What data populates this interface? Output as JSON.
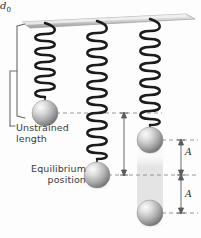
{
  "figure": {
    "background_color": "#fdfdfd",
    "ceiling": {
      "name": "support-ceiling",
      "color_top": "#e9e9e9",
      "color_bottom": "#a8a8a8"
    },
    "colors": {
      "spring": "#1b1b1b",
      "ball_light": "#f2f2f2",
      "ball_mid": "#bdbdbd",
      "ball_dark": "#6f6f6f",
      "dashed_line": "#8c8c8c",
      "bracket": "#6b6b6b",
      "text": "#3a3a3a",
      "blur_trail": "#e3e3e3"
    },
    "labels": {
      "unstrained_line1": "Unstrained",
      "unstrained_line2": "length",
      "equilibrium_line1": "Equilibrium",
      "equilibrium_line2": "position",
      "displacement_symbol": "d",
      "displacement_subscript": "0",
      "amplitude_upper": "A",
      "amplitude_lower": "A"
    },
    "springs": [
      {
        "name": "spring-unstrained",
        "state": "unstrained",
        "coils": 7,
        "top_y": 22,
        "bottom_y": 100,
        "center_x": 45
      },
      {
        "name": "spring-equilibrium",
        "state": "stretched-to-equilibrium",
        "coils": 10,
        "top_y": 22,
        "bottom_y": 162,
        "center_x": 97
      },
      {
        "name": "spring-oscillating",
        "state": "stretched-oscillating",
        "coils": 9,
        "top_y": 22,
        "bottom_y": 128,
        "center_x": 150
      }
    ],
    "balls": [
      {
        "name": "ball-unstrained",
        "cx": 45,
        "cy": 113,
        "r": 13,
        "opacity": 1
      },
      {
        "name": "ball-equilibrium",
        "cx": 97,
        "cy": 175,
        "r": 13,
        "opacity": 1
      },
      {
        "name": "ball-oscillating-top",
        "cx": 150,
        "cy": 140,
        "r": 13,
        "opacity": 1
      },
      {
        "name": "ball-oscillating-bottom",
        "cx": 150,
        "cy": 213,
        "r": 13,
        "opacity": 1
      }
    ],
    "reference_lines": [
      {
        "name": "dashed-unstrained-level",
        "y": 113,
        "x1": 58,
        "x2": 160
      },
      {
        "name": "dashed-equilibrium-level",
        "y": 175,
        "x1": 110,
        "x2": 198
      },
      {
        "name": "dashed-amplitude-top-level",
        "y": 140,
        "x1": 163,
        "x2": 198
      },
      {
        "name": "dashed-amplitude-bottom-level",
        "y": 213,
        "x1": 163,
        "x2": 198
      }
    ],
    "measures": [
      {
        "name": "measure-d0",
        "label": "d0",
        "x": 124,
        "y_top": 113,
        "y_bottom": 175
      },
      {
        "name": "measure-amplitude-upper",
        "label": "A",
        "x": 181,
        "y_top": 140,
        "y_bottom": 175
      },
      {
        "name": "measure-amplitude-lower",
        "label": "A",
        "x": 181,
        "y_top": 175,
        "y_bottom": 213
      }
    ],
    "bracket": {
      "name": "unstrained-length-bracket",
      "x": 16,
      "y_top": 24,
      "y_bottom": 118,
      "tip_x": 10
    },
    "motion_trail": {
      "name": "oscillation-motion-blur",
      "cx": 150,
      "y_top": 150,
      "y_bottom": 222,
      "width": 26
    }
  }
}
